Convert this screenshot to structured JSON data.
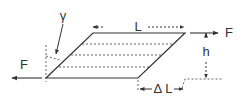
{
  "diagram": {
    "labels": {
      "gamma": "γ",
      "L": "L",
      "h": "h",
      "F_left": "F",
      "F_right": "F",
      "delta_L": "Δ L"
    },
    "colors": {
      "line": "#333333",
      "dashed": "#555555",
      "background": "#ffffff"
    }
  }
}
